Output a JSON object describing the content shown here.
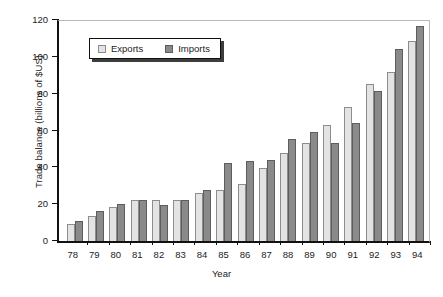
{
  "chart_data": {
    "type": "bar",
    "title": "",
    "xlabel": "Year",
    "ylabel": "Trade balance (billions of $US)",
    "categories": [
      "78",
      "79",
      "80",
      "81",
      "82",
      "83",
      "84",
      "85",
      "86",
      "87",
      "88",
      "89",
      "90",
      "91",
      "92",
      "93",
      "94"
    ],
    "series": [
      {
        "name": "Exports",
        "color": "#e3e3e3",
        "values": [
          9.5,
          13.8,
          18.2,
          22.5,
          22.4,
          22.3,
          26.3,
          27.7,
          31.0,
          39.5,
          47.8,
          53.0,
          62.8,
          72.5,
          85.5,
          91.8,
          108.5
        ]
      },
      {
        "name": "Imports",
        "color": "#8a8a8a",
        "values": [
          11.0,
          16.2,
          20.0,
          22.1,
          19.7,
          22.0,
          27.9,
          42.6,
          43.2,
          43.8,
          55.3,
          59.3,
          53.4,
          64.0,
          81.2,
          104.3,
          116.5
        ]
      }
    ],
    "ylim": [
      0,
      120
    ],
    "yticks": [
      "0",
      "20",
      "40",
      "60",
      "80",
      "100",
      "120"
    ],
    "grid": false,
    "legend_position": "upper-left-inside"
  },
  "legend": {
    "entries": [
      {
        "label": "Exports"
      },
      {
        "label": "Imports"
      }
    ]
  }
}
